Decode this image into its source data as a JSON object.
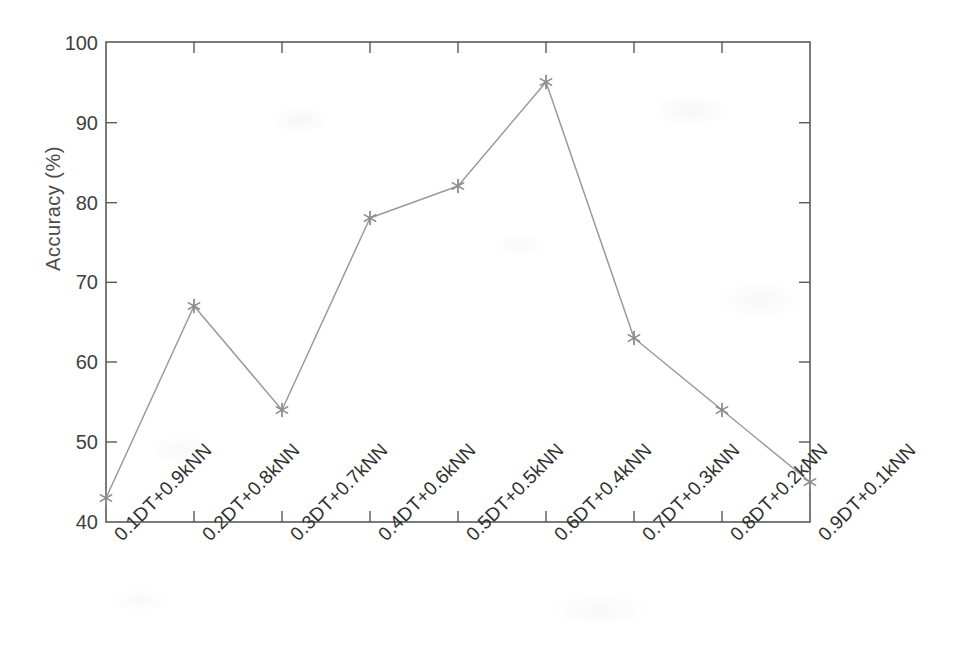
{
  "chart_data": {
    "type": "line",
    "title": "",
    "xlabel": "",
    "ylabel": "Accuracy (%)",
    "ylim": [
      40,
      100
    ],
    "yticks": [
      40,
      50,
      60,
      70,
      80,
      90,
      100
    ],
    "ytick_labels": [
      "40",
      "50",
      "60",
      "70",
      "80",
      "90",
      "100"
    ],
    "grid": false,
    "legend": null,
    "marker": "asterisk",
    "line_color": "#9a9a9a",
    "marker_color": "#8f8f8f",
    "axis_color": "#5a5a5a",
    "categories": [
      "0.1DT+0.9kNN",
      "0.2DT+0.8kNN",
      "0.3DT+0.7kNN",
      "0.4DT+0.6kNN",
      "0.5DT+0.5kNN",
      "0.6DT+0.4kNN",
      "0.7DT+0.3kNN",
      "0.8DT+0.2kNN",
      "0.9DT+0.1kNN"
    ],
    "values": [
      43,
      67,
      54,
      78,
      82,
      95,
      63,
      54,
      45
    ],
    "series": [
      {
        "name": "Accuracy",
        "values": [
          43,
          67,
          54,
          78,
          82,
          95,
          63,
          54,
          45
        ]
      }
    ]
  }
}
